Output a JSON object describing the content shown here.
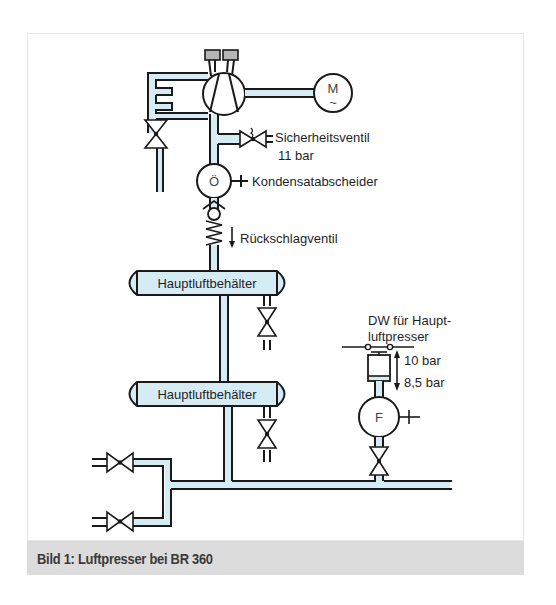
{
  "figure": {
    "caption": "Bild 1:  Luftpresser bei BR 360",
    "colors": {
      "pipe_fill": "#d6ecf5",
      "line": "#1a1a1a",
      "tank_fill": "#d6ecf5",
      "gauge_fill": "#b5b5b5",
      "caption_bg": "#dcdcdc",
      "caption_text": "#3a3a3a"
    }
  },
  "components": {
    "motor": {
      "symbol": "M",
      "sub_symbol": "~"
    },
    "safety_valve": {
      "label": "Sicherheitsventil",
      "setting": "11 bar"
    },
    "condensate_separator": {
      "symbol": "Ö",
      "label": "Kondensatabscheider"
    },
    "check_valve": {
      "label": "Rückschlagventil"
    },
    "main_tank_1": {
      "label": "Hauptluftbehälter"
    },
    "main_tank_2": {
      "label": "Hauptluftbehälter"
    },
    "pressure_switch": {
      "label_line1": "DW für Haupt-",
      "label_line2": "luftpresser",
      "upper": "10 bar",
      "lower": "8,5 bar"
    },
    "filter": {
      "symbol": "F"
    }
  }
}
